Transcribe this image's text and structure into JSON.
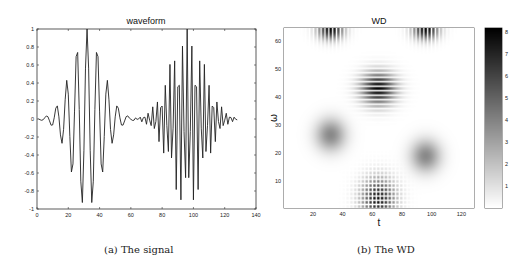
{
  "chart_data": [
    {
      "type": "line",
      "title": "waveform",
      "xlabel": "",
      "ylabel": "",
      "xlim": [
        0,
        140
      ],
      "ylim": [
        -1,
        1
      ],
      "xticks": [
        0,
        20,
        40,
        60,
        80,
        100,
        120,
        140
      ],
      "yticks": [
        -1,
        -0.8,
        -0.6,
        -0.4,
        -0.2,
        0,
        0.2,
        0.4,
        0.6,
        0.8,
        1
      ],
      "ytick_labels": [
        "-1",
        "-0.8",
        "-0.6",
        "-0.4",
        "-0.2",
        "0",
        "0.2",
        "0.4",
        "0.6",
        "0.8",
        "1"
      ],
      "grid": false,
      "n_samples": 128,
      "series": [
        {
          "name": "packet 1",
          "center": 32,
          "width": 10,
          "period": 6.5,
          "amplitude": 1.0
        },
        {
          "name": "packet 2",
          "center": 96,
          "width": 11,
          "period": 2.75,
          "amplitude": 1.0
        }
      ],
      "caption": "(a) The signal"
    },
    {
      "type": "heatmap",
      "title": "WD",
      "xlabel": "t",
      "ylabel": "ω",
      "xlim": [
        0.5,
        128.5
      ],
      "ylim": [
        0.5,
        64.5
      ],
      "xticks": [
        20,
        40,
        60,
        80,
        100,
        120
      ],
      "yticks": [
        10,
        20,
        30,
        40,
        50,
        60
      ],
      "colormap": "gray reversed (white = 0, black = max)",
      "colorbar": {
        "ticks": [
          1,
          2,
          3,
          4,
          5,
          6,
          7,
          8
        ],
        "range": [
          0,
          8.2
        ]
      },
      "components": [
        {
          "kind": "auto-term",
          "t": 32,
          "omega": 26.5,
          "peak": 3.8,
          "sigma_t": 7,
          "sigma_w": 4
        },
        {
          "kind": "auto-term",
          "t": 96,
          "omega": 19,
          "peak": 3.8,
          "sigma_t": 7,
          "sigma_w": 4
        },
        {
          "kind": "cross-term (horizontal stripes)",
          "t": 64,
          "omega": 43,
          "peak": 8,
          "sigma_t": 8,
          "sigma_w": 4
        },
        {
          "kind": "cross-term (checker)",
          "t": 64,
          "omega": 4,
          "peak": 8,
          "sigma_t": 8,
          "sigma_w": 5
        },
        {
          "kind": "alias strip",
          "t": 32,
          "omega": 64,
          "peak": 8,
          "sigma_t": 6,
          "sigma_w": 2.5
        },
        {
          "kind": "alias strip",
          "t": 96,
          "omega": 64,
          "peak": 8,
          "sigma_t": 6,
          "sigma_w": 2.5
        }
      ],
      "caption": "(b) The WD"
    }
  ]
}
